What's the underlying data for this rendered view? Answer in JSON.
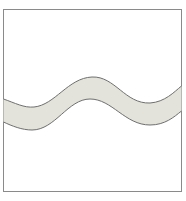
{
  "figure": {
    "frame": {
      "x": 3,
      "y": 9,
      "width": 179,
      "height": 182,
      "stroke": "#8a8a8a"
    },
    "wave_band": {
      "fill": "#e3e3db",
      "stroke": "#6f6f6f",
      "upper_edge": [
        [
          3,
          99
        ],
        [
          30,
          107
        ],
        [
          92,
          77
        ],
        [
          150,
          103
        ],
        [
          182,
          86
        ]
      ],
      "lower_edge": [
        [
          3,
          122
        ],
        [
          30,
          130
        ],
        [
          90,
          99
        ],
        [
          150,
          125
        ],
        [
          182,
          111
        ]
      ]
    }
  }
}
